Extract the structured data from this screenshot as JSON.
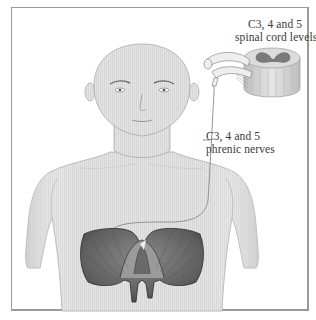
{
  "figure": {
    "labels": {
      "spinal_cord": {
        "line1": "C3, 4 and 5",
        "line2": "spinal cord levels"
      },
      "phrenic_nerves": {
        "line1": "C3, 4 and 5",
        "line2": "phrenic nerves"
      }
    },
    "structures": [
      "head",
      "torso",
      "spinal-cord-cross-section",
      "nerve-roots",
      "phrenic-nerve",
      "diaphragm"
    ],
    "colors": {
      "frame": "#9a9a9a",
      "skin": "#e2e2e2",
      "skin_outline": "#a8a8a8",
      "diaphragm": "#6a6a6a",
      "diaphragm_dark": "#3c3c3c",
      "nerve": "#8a8a8a",
      "grey_matter": "#7a7a7a",
      "text": "#3a3a3a"
    }
  }
}
